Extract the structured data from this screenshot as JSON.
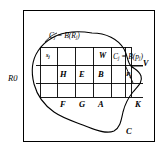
{
  "figure": {
    "outer_region_label": "R",
    "outer_region_sub": "0",
    "curve_label": "C",
    "top_equation": {
      "lhs": "C",
      "lhs_sub": "j",
      "eq": " = ",
      "rhs_fn": "B",
      "rhs_open": "(",
      "rhs_arg": "R",
      "rhs_arg_sub": "j",
      "rhs_close": ")",
      "full": "Cj = B(Rj)"
    },
    "right_equation": {
      "lhs": "C",
      "lhs_sub": "j",
      "eq": " = ",
      "rhs_fn": "B",
      "rhs_open": "(",
      "rhs_arg": "p",
      "rhs_arg_sub": "j",
      "rhs_close": ")",
      "full": "Cj = B(pj)"
    },
    "cell_labels": [
      {
        "text": "H"
      },
      {
        "text": "E"
      },
      {
        "text": "B"
      },
      {
        "text": "W"
      },
      {
        "text": "V"
      },
      {
        "text": "F"
      },
      {
        "text": "G"
      },
      {
        "text": "A"
      },
      {
        "text": "K"
      }
    ],
    "point_labels": [
      {
        "text": "s",
        "sub": "j"
      },
      {
        "text": "P",
        "sub": "j"
      }
    ],
    "colors": {
      "stroke": "#000000",
      "background": "#ffffff",
      "grid": "#000000"
    }
  }
}
